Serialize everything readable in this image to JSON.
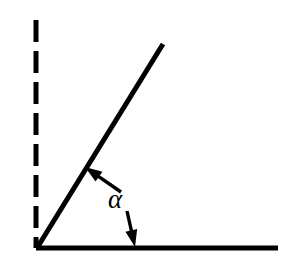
{
  "figure": {
    "type": "geometry-diagram",
    "canvas": {
      "width": 286,
      "height": 266,
      "background": "#ffffff"
    },
    "ink_color": "#000000",
    "labels": {
      "angle_symbol": "α"
    },
    "elements": {
      "vertex": {
        "name": "vertex",
        "x": 37,
        "y": 248
      },
      "vertical_dashed_line": {
        "name": "vertical-dashed-reference-line",
        "x1": 36,
        "y1": 20,
        "x2": 36,
        "y2": 248,
        "stroke_width": 5,
        "dash": 22,
        "gap": 9,
        "style": "dashed"
      },
      "horizontal_ray": {
        "name": "horizontal-baseline-ray",
        "x1": 36,
        "y1": 248,
        "x2": 278,
        "y2": 248,
        "stroke_width": 5,
        "style": "solid"
      },
      "inclined_ray": {
        "name": "inclined-ray",
        "x1": 37,
        "y1": 248,
        "x2": 163,
        "y2": 44,
        "stroke_width": 5,
        "style": "solid",
        "angle_degrees": 58
      },
      "upper_arrow": {
        "name": "arrow-to-inclined-ray",
        "tail_x": 121,
        "tail_y": 192,
        "tip_x": 85,
        "tip_y": 167,
        "stroke_width": 3.4,
        "head_length": 17,
        "head_width": 12
      },
      "lower_arrow": {
        "name": "arrow-to-horizontal-ray",
        "tail_x": 127,
        "tail_y": 211,
        "tip_x": 135,
        "tip_y": 247,
        "stroke_width": 3.4,
        "head_length": 17,
        "head_width": 12
      }
    }
  }
}
